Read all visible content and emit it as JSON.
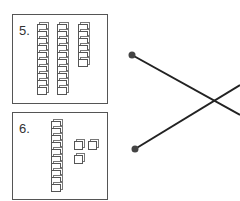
{
  "problems": [
    {
      "label": "5.",
      "tens": 3,
      "rods": [
        10,
        10,
        6
      ],
      "units": 0
    },
    {
      "label": "6.",
      "tens": 1,
      "rods": [
        10
      ],
      "units": 3
    }
  ],
  "matching_lines": [
    {
      "from": [
        132,
        55
      ],
      "to": [
        240,
        115
      ]
    },
    {
      "from": [
        135,
        149
      ],
      "to": [
        240,
        85
      ]
    }
  ],
  "colors": {
    "line": "#222222",
    "dot": "#444444",
    "border": "#555555"
  }
}
